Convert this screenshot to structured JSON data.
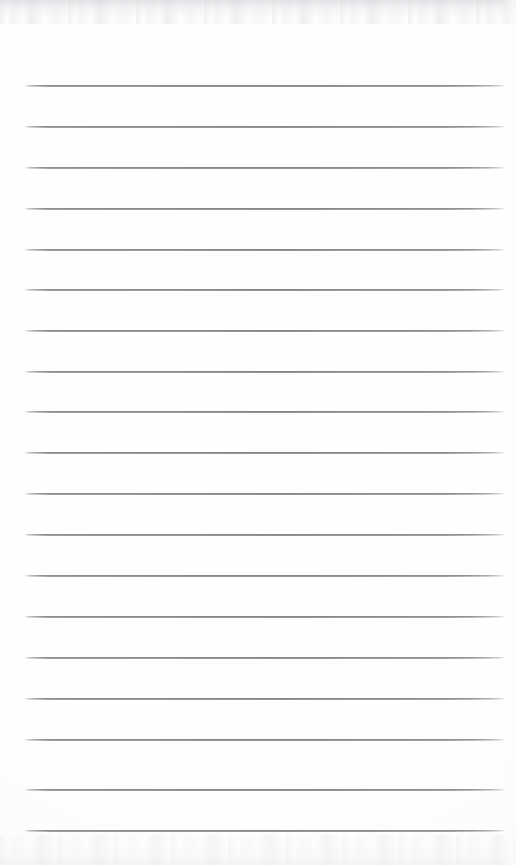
{
  "document": {
    "kind": "scanned-blank-lined-notepad-page",
    "title": "Lined Notepad Page",
    "page_width": 516,
    "page_height": 865,
    "background_color": "#ffffff",
    "has_text_content": false,
    "written_content": "",
    "header_text": "",
    "footer_text": "",
    "page_number": ""
  },
  "ruling": {
    "line_count": 19,
    "line_color": "#8d8f94",
    "line_thickness_px": 1,
    "line_left_x": 24,
    "line_right_x": 504,
    "line_width_px": 480,
    "first_line_y": 86,
    "line_spacing_px": 41.4,
    "top_margin_px": 86,
    "bottom_margin_px": 34,
    "left_margin_px": 24,
    "right_margin_px": 12,
    "has_vertical_margin_rule": false,
    "lines_y": [
      86,
      127,
      168,
      209,
      250,
      290,
      331,
      372,
      412,
      453,
      494,
      535,
      576,
      617,
      658,
      699,
      740,
      790,
      831
    ]
  },
  "texture": {
    "top_edge_shadow": true,
    "bottom_edge_shadow": true,
    "right_edge_sheen": true,
    "top_edge_color": "#d6d8db",
    "bottom_edge_color": "#ecedef"
  }
}
